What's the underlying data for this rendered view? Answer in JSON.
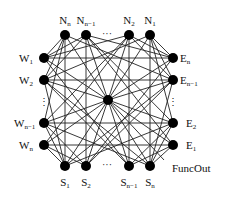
{
  "diagram": {
    "type": "network-topology",
    "center": {
      "id": "C",
      "x": 108,
      "y": 100,
      "r": 5
    },
    "output": {
      "label": "FuncOut",
      "x": 172,
      "y": 172,
      "line_end": [
        164,
        160
      ]
    },
    "nodes": [
      {
        "id": "Nn",
        "base": "N",
        "sub": "n",
        "x": 65,
        "y": 35,
        "lx": 65,
        "ly": 24,
        "anchor": "middle"
      },
      {
        "id": "Nn1",
        "base": "N",
        "sub": "n−1",
        "x": 86,
        "y": 35,
        "lx": 86,
        "ly": 24,
        "anchor": "middle"
      },
      {
        "id": "N2",
        "base": "N",
        "sub": "2",
        "x": 129,
        "y": 35,
        "lx": 129,
        "ly": 24,
        "anchor": "middle"
      },
      {
        "id": "N1",
        "base": "N",
        "sub": "1",
        "x": 150,
        "y": 35,
        "lx": 150,
        "ly": 24,
        "anchor": "middle"
      },
      {
        "id": "W1",
        "base": "W",
        "sub": "1",
        "x": 44,
        "y": 58,
        "lx": 19,
        "ly": 62,
        "anchor": "start"
      },
      {
        "id": "W2",
        "base": "W",
        "sub": "2",
        "x": 44,
        "y": 80,
        "lx": 19,
        "ly": 84,
        "anchor": "start"
      },
      {
        "id": "Wn1",
        "base": "W",
        "sub": "n−1",
        "x": 44,
        "y": 123,
        "lx": 14,
        "ly": 127,
        "anchor": "start"
      },
      {
        "id": "Wn",
        "base": "W",
        "sub": "n",
        "x": 44,
        "y": 145,
        "lx": 19,
        "ly": 149,
        "anchor": "start"
      },
      {
        "id": "En",
        "base": "E",
        "sub": "n",
        "x": 173,
        "y": 58,
        "lx": 180,
        "ly": 62,
        "anchor": "start"
      },
      {
        "id": "En1",
        "base": "E",
        "sub": "n−1",
        "x": 173,
        "y": 80,
        "lx": 180,
        "ly": 84,
        "anchor": "start"
      },
      {
        "id": "E2",
        "base": "E",
        "sub": "2",
        "x": 173,
        "y": 123,
        "lx": 186,
        "ly": 127,
        "anchor": "start"
      },
      {
        "id": "E1",
        "base": "E",
        "sub": "1",
        "x": 173,
        "y": 145,
        "lx": 186,
        "ly": 149,
        "anchor": "start"
      },
      {
        "id": "S1",
        "base": "S",
        "sub": "1",
        "x": 65,
        "y": 166,
        "lx": 65,
        "ly": 186,
        "anchor": "middle"
      },
      {
        "id": "S2",
        "base": "S",
        "sub": "2",
        "x": 86,
        "y": 166,
        "lx": 86,
        "ly": 186,
        "anchor": "middle"
      },
      {
        "id": "Sn1",
        "base": "S",
        "sub": "n−1",
        "x": 129,
        "y": 166,
        "lx": 129,
        "ly": 186,
        "anchor": "middle"
      },
      {
        "id": "Sn",
        "base": "S",
        "sub": "n",
        "x": 150,
        "y": 166,
        "lx": 150,
        "ly": 186,
        "anchor": "middle"
      }
    ],
    "ellipses": [
      {
        "text": "···",
        "x": 107,
        "y": 37
      },
      {
        "text": "···",
        "x": 107,
        "y": 168
      },
      {
        "text": "⋮",
        "x": 44,
        "y": 105
      },
      {
        "text": "⋮",
        "x": 173,
        "y": 105
      }
    ],
    "edges": [
      [
        "W1",
        "En"
      ],
      [
        "W2",
        "En1"
      ],
      [
        "Wn1",
        "E2"
      ],
      [
        "Wn",
        "E1"
      ],
      [
        "Nn",
        "S1"
      ],
      [
        "Nn1",
        "S2"
      ],
      [
        "N2",
        "Sn1"
      ],
      [
        "N1",
        "Sn"
      ],
      [
        "Nn",
        "W1"
      ],
      [
        "Nn",
        "W2"
      ],
      [
        "Nn",
        "Wn1"
      ],
      [
        "Nn1",
        "W1"
      ],
      [
        "Nn1",
        "W2"
      ],
      [
        "N1",
        "En"
      ],
      [
        "N1",
        "En1"
      ],
      [
        "N1",
        "E2"
      ],
      [
        "N2",
        "En"
      ],
      [
        "N2",
        "En1"
      ],
      [
        "Sn",
        "E1"
      ],
      [
        "Sn",
        "E2"
      ],
      [
        "Sn",
        "En1"
      ],
      [
        "Sn1",
        "E1"
      ],
      [
        "Sn1",
        "E2"
      ],
      [
        "S1",
        "Wn"
      ],
      [
        "S1",
        "Wn1"
      ],
      [
        "S1",
        "W2"
      ],
      [
        "S2",
        "Wn"
      ],
      [
        "S2",
        "Wn1"
      ],
      [
        "Nn",
        "En1"
      ],
      [
        "Nn1",
        "E2"
      ],
      [
        "N2",
        "Wn1"
      ],
      [
        "N1",
        "W2"
      ],
      [
        "S1",
        "E2"
      ],
      [
        "S2",
        "En1"
      ],
      [
        "Sn1",
        "W2"
      ],
      [
        "Sn",
        "Wn1"
      ],
      [
        "W1",
        "Sn1"
      ],
      [
        "W2",
        "Sn"
      ],
      [
        "En",
        "S2"
      ],
      [
        "En1",
        "S1"
      ],
      [
        "W1",
        "N2"
      ],
      [
        "Wn",
        "N2"
      ],
      [
        "En",
        "Nn1"
      ],
      [
        "E1",
        "Nn1"
      ]
    ],
    "center_edges": [
      "Nn",
      "Nn1",
      "N2",
      "N1",
      "W1",
      "W2",
      "Wn1",
      "Wn",
      "En",
      "En1",
      "E2",
      "E1",
      "S1",
      "S2",
      "Sn1",
      "Sn"
    ]
  }
}
